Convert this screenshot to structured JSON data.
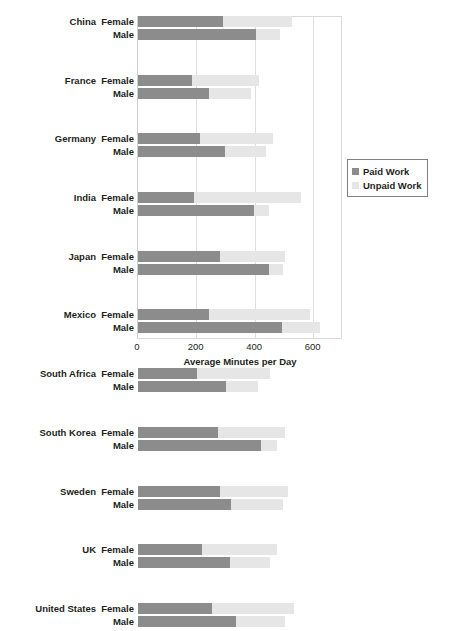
{
  "chart_data": {
    "type": "bar",
    "orientation": "horizontal",
    "stacked": true,
    "title": "",
    "xlabel": "Average Minutes per Day",
    "ylabel": "",
    "xlim": [
      0,
      700
    ],
    "xticks": [
      0,
      200,
      400,
      600
    ],
    "xtick_labels": [
      "0",
      "200",
      "400",
      "600"
    ],
    "grid": "vertical",
    "legend_position": "right",
    "series": [
      {
        "name": "Paid Work",
        "color": "#8c8c8c"
      },
      {
        "name": "Unpaid Work",
        "color": "#e6e6e6"
      }
    ],
    "groups": [
      {
        "country": "China",
        "rows": [
          {
            "sex": "Female",
            "paid": 291,
            "unpaid": 236,
            "total": 527
          },
          {
            "sex": "Male",
            "paid": 404,
            "unpaid": 82,
            "total": 486
          }
        ]
      },
      {
        "country": "France",
        "rows": [
          {
            "sex": "Female",
            "paid": 184,
            "unpaid": 228,
            "total": 412
          },
          {
            "sex": "Male",
            "paid": 244,
            "unpaid": 143,
            "total": 387
          }
        ]
      },
      {
        "country": "Germany",
        "rows": [
          {
            "sex": "Female",
            "paid": 212,
            "unpaid": 249,
            "total": 461
          },
          {
            "sex": "Male",
            "paid": 298,
            "unpaid": 140,
            "total": 438
          }
        ]
      },
      {
        "country": "India",
        "rows": [
          {
            "sex": "Female",
            "paid": 191,
            "unpaid": 367,
            "total": 558
          },
          {
            "sex": "Male",
            "paid": 397,
            "unpaid": 50,
            "total": 447
          }
        ]
      },
      {
        "country": "Japan",
        "rows": [
          {
            "sex": "Female",
            "paid": 279,
            "unpaid": 224,
            "total": 503
          },
          {
            "sex": "Male",
            "paid": 447,
            "unpaid": 49,
            "total": 496
          }
        ]
      },
      {
        "country": "Mexico",
        "rows": [
          {
            "sex": "Female",
            "paid": 241,
            "unpaid": 346,
            "total": 587
          },
          {
            "sex": "Male",
            "paid": 490,
            "unpaid": 131,
            "total": 621
          }
        ]
      },
      {
        "country": "South Africa",
        "rows": [
          {
            "sex": "Female",
            "paid": 200,
            "unpaid": 250,
            "total": 450
          },
          {
            "sex": "Male",
            "paid": 301,
            "unpaid": 109,
            "total": 410
          }
        ]
      },
      {
        "country": "South Korea",
        "rows": [
          {
            "sex": "Female",
            "paid": 273,
            "unpaid": 228,
            "total": 501
          },
          {
            "sex": "Male",
            "paid": 421,
            "unpaid": 52,
            "total": 473
          }
        ]
      },
      {
        "country": "Sweden",
        "rows": [
          {
            "sex": "Female",
            "paid": 279,
            "unpaid": 232,
            "total": 511
          },
          {
            "sex": "Male",
            "paid": 317,
            "unpaid": 179,
            "total": 496
          }
        ]
      },
      {
        "country": "UK",
        "rows": [
          {
            "sex": "Female",
            "paid": 219,
            "unpaid": 256,
            "total": 475
          },
          {
            "sex": "Male",
            "paid": 313,
            "unpaid": 137,
            "total": 450
          }
        ]
      },
      {
        "country": "United States",
        "rows": [
          {
            "sex": "Female",
            "paid": 253,
            "unpaid": 279,
            "total": 532
          },
          {
            "sex": "Male",
            "paid": 336,
            "unpaid": 167,
            "total": 503
          }
        ]
      }
    ]
  },
  "legend": {
    "items": [
      {
        "label": "Paid Work",
        "color": "#8c8c8c"
      },
      {
        "label": "Unpaid Work",
        "color": "#e6e6e6"
      }
    ]
  },
  "axis": {
    "title": "Average Minutes per Day",
    "ticks": [
      "0",
      "200",
      "400",
      "600"
    ]
  }
}
